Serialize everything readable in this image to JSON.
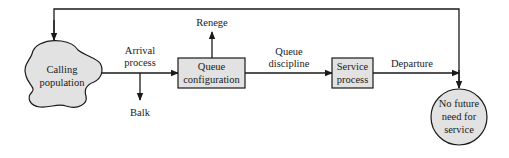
{
  "diagram": {
    "colors": {
      "shape_fill": "#e2e2e2",
      "stroke": "#1a1a1a",
      "background": "#ffffff"
    },
    "nodes": {
      "calling_population": {
        "label_line1": "Calling",
        "label_line2": "population",
        "shape": "cloud"
      },
      "queue_configuration": {
        "label_line1": "Queue",
        "label_line2": "configuration",
        "shape": "rectangle"
      },
      "service_process": {
        "label_line1": "Service",
        "label_line2": "process",
        "shape": "rectangle"
      },
      "no_future_need": {
        "label_line1": "No future",
        "label_line2": "need for",
        "label_line3": "service",
        "shape": "circle"
      }
    },
    "edge_labels": {
      "arrival": {
        "line1": "Arrival",
        "line2": "process"
      },
      "balk": "Balk",
      "renege": "Renege",
      "queue_discipline": {
        "line1": "Queue",
        "line2": "discipline"
      },
      "departure": "Departure"
    },
    "edges": [
      {
        "from": "calling_population",
        "to": "queue_configuration",
        "label": "Arrival process"
      },
      {
        "from": "arrival_line",
        "to": "balk",
        "label": "Balk"
      },
      {
        "from": "queue_configuration",
        "to": "renege",
        "label": "Renege"
      },
      {
        "from": "queue_configuration",
        "to": "service_process",
        "label": "Queue discipline"
      },
      {
        "from": "service_process",
        "to": "no_future_need",
        "label": "Departure"
      },
      {
        "from": "feedback_loop",
        "to": "calling_population",
        "label": ""
      },
      {
        "from": "feedback_loop",
        "to": "no_future_need",
        "label": ""
      }
    ]
  }
}
